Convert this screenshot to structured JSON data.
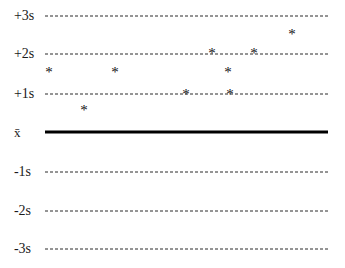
{
  "chart_data": {
    "type": "scatter",
    "title": "",
    "subtitle": "",
    "xlabel": "",
    "ylabel": "",
    "legend": [],
    "grid": true,
    "grid_style": "dashed horizontal reference lines",
    "marker": "*",
    "marker_color": "#111111",
    "y_axis_kind": "standard-deviation reference levels",
    "ylim": [
      -3.5,
      3.5
    ],
    "ytick_labels": [
      "+3s",
      "+2s",
      "+1s",
      "x̄",
      "-1s",
      "-2s",
      "-3s"
    ],
    "ytick_values": [
      3,
      2,
      1,
      0,
      -1,
      -2,
      -3
    ],
    "reference_lines": [
      {
        "label": "+3s",
        "value": 3,
        "style": "dashed",
        "color": "#2b2b2b",
        "width_px": 1
      },
      {
        "label": "+2s",
        "value": 2,
        "style": "dashed",
        "color": "#2b2b2b",
        "width_px": 1
      },
      {
        "label": "+1s",
        "value": 1,
        "style": "dashed",
        "color": "#2b2b2b",
        "width_px": 1
      },
      {
        "label": "x̄",
        "value": 0,
        "style": "solid",
        "color": "#000000",
        "width_px": 3
      },
      {
        "label": "-1s",
        "value": -1,
        "style": "dashed",
        "color": "#2b2b2b",
        "width_px": 1
      },
      {
        "label": "-2s",
        "value": -2,
        "style": "dashed",
        "color": "#2b2b2b",
        "width_px": 1
      },
      {
        "label": "-3s",
        "value": -3,
        "style": "dashed",
        "color": "#2b2b2b",
        "width_px": 1
      }
    ],
    "x": [
      1,
      2,
      3,
      4,
      5,
      6,
      7,
      8,
      9
    ],
    "y": [
      1.53,
      0.59,
      1.53,
      1.05,
      2.0,
      1.53,
      1.05,
      2.0,
      2.55
    ],
    "points": [
      {
        "index": 1,
        "x_px": 49,
        "y_px": 71,
        "value": 1.53,
        "marker": "*"
      },
      {
        "index": 2,
        "x_px": 84,
        "y_px": 109,
        "value": 0.59,
        "marker": "*"
      },
      {
        "index": 3,
        "x_px": 115,
        "y_px": 71,
        "value": 1.53,
        "marker": "*"
      },
      {
        "index": 4,
        "x_px": 186,
        "y_px": 93,
        "value": 1.02,
        "marker": "*"
      },
      {
        "index": 5,
        "x_px": 212,
        "y_px": 52,
        "value": 2.05,
        "marker": "*"
      },
      {
        "index": 6,
        "x_px": 228,
        "y_px": 71,
        "value": 1.53,
        "marker": "*"
      },
      {
        "index": 7,
        "x_px": 230,
        "y_px": 93,
        "value": 1.02,
        "marker": "*"
      },
      {
        "index": 8,
        "x_px": 254,
        "y_px": 52,
        "value": 2.05,
        "marker": "*"
      },
      {
        "index": 9,
        "x_px": 292,
        "y_px": 33,
        "value": 2.55,
        "marker": "*"
      }
    ],
    "geometry": {
      "plot_left_px": 45,
      "plot_right_px": 328,
      "label_x_px": 14,
      "line_y_px": {
        "p3s": 16,
        "p2s": 54,
        "p1s": 94,
        "mean": 132,
        "m1s": 172,
        "m2s": 211,
        "m3s": 249
      }
    }
  }
}
